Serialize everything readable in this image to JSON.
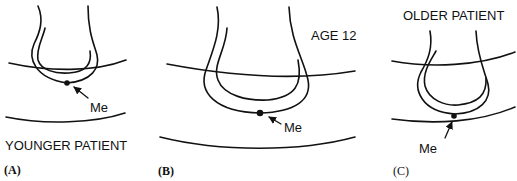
{
  "figure": {
    "panels": [
      {
        "id": "A",
        "caption": "(A)",
        "title": "YOUNGER PATIENT",
        "landmark_label": "Me"
      },
      {
        "id": "B",
        "caption": "(B)",
        "title": "AGE 12",
        "landmark_label": "Me"
      },
      {
        "id": "C",
        "caption": "(C)",
        "title": "OLDER PATIENT",
        "landmark_label": "Me"
      }
    ],
    "colors": {
      "stroke": "#111111",
      "background": "#ffffff"
    }
  }
}
